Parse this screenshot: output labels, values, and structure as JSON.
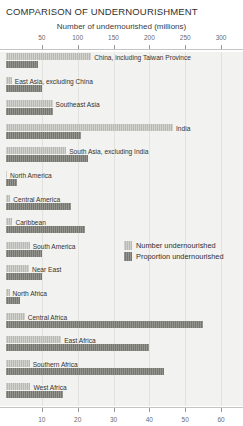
{
  "chart_data": {
    "type": "bar",
    "orientation": "horizontal",
    "title": "COMPARISON OF UNDERNOURISHMENT",
    "xlabel": "Number of undernourished (millions)",
    "ylabel": "",
    "grid": true,
    "legend_position": "middle-right",
    "top_axis": {
      "label": "Number of undernourished (millions)",
      "ticks": [
        50,
        100,
        150,
        200,
        250,
        300
      ],
      "tick_labels": [
        "50",
        "100",
        "150",
        "200",
        "250",
        "300"
      ],
      "range": [
        0,
        325
      ]
    },
    "bottom_axis": {
      "label": "",
      "ticks": [
        10,
        20,
        30,
        40,
        50,
        60
      ],
      "tick_labels": [
        "10",
        "20",
        "30",
        "40",
        "50",
        "60"
      ],
      "range": [
        0,
        65
      ]
    },
    "categories": [
      "China, including Taiwan Province",
      "East Asia, excluding China",
      "Southeast Asia",
      "India",
      "South Asia, excluding India",
      "North America",
      "Central America",
      "Caribbean",
      "South America",
      "Near East",
      "North Africa",
      "Central Africa",
      "East Africa",
      "Southern Africa",
      "West Africa"
    ],
    "series": [
      {
        "name": "Number undernourished",
        "unit": "millions",
        "axis": "top",
        "color": "#b9b9b2",
        "values": [
          119,
          8,
          65,
          233,
          84,
          0.5,
          6,
          9,
          33,
          32,
          5,
          26,
          77,
          33,
          34
        ]
      },
      {
        "name": "Proportion undernourished",
        "unit": "percent",
        "axis": "bottom",
        "color": "#76766e",
        "values": [
          9,
          10,
          13,
          21,
          23,
          3,
          18,
          22,
          10,
          10,
          4,
          55,
          40,
          44,
          16
        ]
      }
    ]
  },
  "legend": {
    "items": [
      {
        "label": "Number undernourished",
        "swatch": "s-number"
      },
      {
        "label": "Proportion undernourished",
        "swatch": "s-proportion"
      }
    ]
  }
}
